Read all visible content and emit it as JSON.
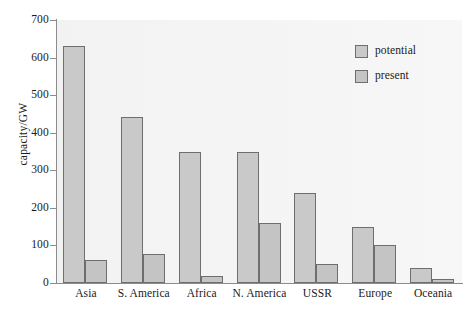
{
  "chart_data": {
    "type": "bar",
    "title": "",
    "xlabel": "",
    "ylabel": "capacity/GW",
    "ylim": [
      0,
      700
    ],
    "yticks": [
      0,
      100,
      200,
      300,
      400,
      500,
      600,
      700
    ],
    "ytick_labels": [
      "0",
      "100",
      "200",
      "300",
      "400",
      "500",
      "600",
      "700"
    ],
    "grid": false,
    "legend_position": "top-right",
    "categories": [
      "Asia",
      "S. America",
      "Africa",
      "N. America",
      "USSR",
      "Europe",
      "Oceania"
    ],
    "series": [
      {
        "name": "potential",
        "color": "#c9c9c9",
        "values": [
          630,
          442,
          350,
          350,
          240,
          150,
          40
        ]
      },
      {
        "name": "present",
        "color": "#c4c4c4",
        "values": [
          61,
          77,
          19,
          160,
          50,
          100,
          10
        ]
      }
    ]
  },
  "legend": {
    "items": [
      {
        "label": "potential"
      },
      {
        "label": "present"
      }
    ]
  },
  "axes": {
    "y_title": "capacity/GW"
  }
}
